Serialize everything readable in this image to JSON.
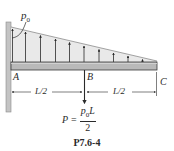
{
  "diagram": {
    "type": "cantilever-beam-loading",
    "load_label": "p",
    "load_label_sub": "0",
    "points": [
      {
        "id": "A",
        "label": "A"
      },
      {
        "id": "B",
        "label": "B"
      },
      {
        "id": "C",
        "label": "C"
      }
    ],
    "dimensions": [
      {
        "label": "L/2",
        "from": "A",
        "to": "B"
      },
      {
        "label": "L/2",
        "from": "B",
        "to": "C"
      }
    ],
    "point_load": {
      "lhs": "P",
      "equals": "=",
      "numerator_base": "p",
      "numerator_sub": "0",
      "numerator_tail": "L",
      "denominator": "2"
    },
    "caption": "P7.6-4",
    "colors": {
      "ink": "#2a2a2a",
      "beam_fill": "#b9b9b9",
      "load_fill": "#e9e9e9",
      "wall_fill": "#c4c4c4"
    }
  }
}
